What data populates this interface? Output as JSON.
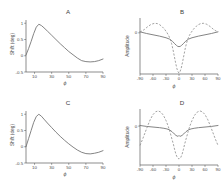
{
  "figure": {
    "panel_letters": {
      "a": "A",
      "b": "B",
      "c": "C",
      "d": "D"
    },
    "axis_labels": {
      "shift": "Shift (deg)",
      "amplitude": "Amplitude",
      "phi": "ϕ"
    }
  },
  "chart_data": [
    {
      "id": "A",
      "type": "line",
      "title": "A",
      "xlabel": "ϕ",
      "ylabel": "Shift (deg)",
      "xlim": [
        0,
        90
      ],
      "ylim": [
        -0.5,
        1.1
      ],
      "xticks": [
        10,
        30,
        50,
        70,
        90
      ],
      "yticks": [
        -0.5,
        0,
        0.5,
        1
      ],
      "ytick_labels": [
        "-0.5",
        "0",
        "0.5",
        "1"
      ],
      "grid": false,
      "legend": "none",
      "series": [
        {
          "name": "shift",
          "style": "solid",
          "color": "#6e6e6e",
          "x": [
            0,
            3,
            6,
            9,
            12,
            15,
            18,
            21,
            25,
            30,
            35,
            40,
            45,
            50,
            55,
            60,
            65,
            70,
            75,
            80,
            85,
            90
          ],
          "y": [
            0.02,
            0.22,
            0.44,
            0.68,
            0.88,
            0.97,
            0.93,
            0.86,
            0.76,
            0.63,
            0.5,
            0.37,
            0.25,
            0.13,
            0.03,
            -0.07,
            -0.15,
            -0.18,
            -0.19,
            -0.18,
            -0.15,
            -0.1
          ]
        }
      ]
    },
    {
      "id": "B",
      "type": "line",
      "title": "B",
      "xlabel": "ϕ",
      "ylabel": "Amplitude",
      "xlim": [
        -90,
        90
      ],
      "ylim": [
        -1.25,
        0.45
      ],
      "xticks": [
        -90,
        -60,
        -30,
        0,
        30,
        60,
        90
      ],
      "yticks": [
        0
      ],
      "ytick_labels": [
        "0"
      ],
      "grid": false,
      "legend": "none",
      "series": [
        {
          "name": "amplitude-solid",
          "style": "solid",
          "color": "#6e6e6e",
          "x": [
            -90,
            -75,
            -60,
            -45,
            -30,
            -22,
            -15,
            -10,
            -6,
            -3,
            0,
            3,
            6,
            10,
            15,
            22,
            30,
            45,
            60,
            75,
            90
          ],
          "y": [
            0.03,
            -0.02,
            -0.06,
            -0.1,
            -0.15,
            -0.19,
            -0.26,
            -0.33,
            -0.38,
            -0.41,
            -0.42,
            -0.41,
            -0.38,
            -0.33,
            -0.26,
            -0.19,
            -0.15,
            -0.1,
            -0.06,
            -0.02,
            0.03
          ]
        },
        {
          "name": "amplitude-dashed",
          "style": "dashed",
          "color": "#8a8a8a",
          "x": [
            -90,
            -80,
            -72,
            -64,
            -56,
            -50,
            -45,
            -40,
            -34,
            -28,
            -24,
            -20,
            -17,
            -14,
            -11,
            -8,
            -5,
            -2,
            0,
            2,
            5,
            8,
            11,
            14,
            17,
            20,
            24,
            28,
            34,
            40,
            45,
            50,
            56,
            64,
            72,
            80,
            90
          ],
          "y": [
            0.02,
            0.1,
            0.19,
            0.26,
            0.29,
            0.28,
            0.25,
            0.2,
            0.12,
            0.01,
            -0.08,
            -0.2,
            -0.33,
            -0.5,
            -0.7,
            -0.9,
            -1.08,
            -1.19,
            -1.22,
            -1.19,
            -1.08,
            -0.9,
            -0.7,
            -0.5,
            -0.33,
            -0.2,
            -0.08,
            0.01,
            0.12,
            0.2,
            0.25,
            0.28,
            0.29,
            0.26,
            0.19,
            0.1,
            0.02
          ]
        }
      ]
    },
    {
      "id": "C",
      "type": "line",
      "title": "C",
      "xlabel": "ϕ",
      "ylabel": "Shift (deg)",
      "xlim": [
        0,
        90
      ],
      "ylim": [
        -0.5,
        1.1
      ],
      "xticks": [
        10,
        30,
        50,
        70,
        90
      ],
      "yticks": [
        -0.5,
        0,
        0.5,
        1
      ],
      "ytick_labels": [
        "-0.5",
        "0",
        "0.5",
        "1"
      ],
      "grid": false,
      "legend": "none",
      "series": [
        {
          "name": "shift",
          "style": "solid",
          "color": "#6e6e6e",
          "x": [
            0,
            3,
            6,
            9,
            12,
            15,
            18,
            21,
            25,
            30,
            35,
            40,
            45,
            50,
            55,
            60,
            65,
            70,
            75,
            80,
            85,
            90
          ],
          "y": [
            0.0,
            0.25,
            0.5,
            0.75,
            0.93,
            1.0,
            0.94,
            0.85,
            0.73,
            0.59,
            0.45,
            0.32,
            0.2,
            0.09,
            -0.01,
            -0.1,
            -0.17,
            -0.21,
            -0.22,
            -0.2,
            -0.17,
            -0.12
          ]
        }
      ]
    },
    {
      "id": "D",
      "type": "line",
      "title": "D",
      "xlabel": "ϕ",
      "ylabel": "Amplitude",
      "xlim": [
        -90,
        90
      ],
      "ylim": [
        -1.25,
        0.55
      ],
      "xticks": [
        -90,
        -60,
        -30,
        0,
        30,
        60,
        90
      ],
      "yticks": [
        0
      ],
      "ytick_labels": [
        "0"
      ],
      "grid": false,
      "legend": "none",
      "series": [
        {
          "name": "amplitude-solid",
          "style": "solid",
          "color": "#6e6e6e",
          "x": [
            -90,
            -75,
            -60,
            -45,
            -35,
            -28,
            -22,
            -16,
            -11,
            -7,
            -4,
            -2,
            0,
            2,
            4,
            7,
            11,
            16,
            22,
            28,
            35,
            45,
            60,
            75,
            90
          ],
          "y": [
            0.02,
            -0.01,
            -0.03,
            -0.05,
            -0.07,
            -0.09,
            -0.12,
            -0.18,
            -0.25,
            -0.3,
            -0.32,
            -0.33,
            -0.3,
            -0.33,
            -0.32,
            -0.3,
            -0.25,
            -0.18,
            -0.12,
            -0.09,
            -0.07,
            -0.05,
            -0.03,
            -0.01,
            0.02
          ]
        },
        {
          "name": "amplitude-dashed",
          "style": "dashed",
          "color": "#8a8a8a",
          "x": [
            -90,
            -84,
            -78,
            -72,
            -66,
            -60,
            -54,
            -48,
            -42,
            -36,
            -30,
            -25,
            -21,
            -17,
            -13,
            -10,
            -7,
            -4,
            0,
            4,
            7,
            10,
            13,
            17,
            21,
            25,
            30,
            36,
            42,
            48,
            54,
            60,
            66,
            72,
            78,
            84,
            90
          ],
          "y": [
            -0.62,
            -0.42,
            -0.2,
            0.02,
            0.22,
            0.37,
            0.46,
            0.49,
            0.45,
            0.35,
            0.18,
            0.0,
            -0.18,
            -0.38,
            -0.58,
            -0.76,
            -0.91,
            -1.01,
            -1.06,
            -1.01,
            -0.91,
            -0.76,
            -0.58,
            -0.38,
            -0.18,
            0.0,
            0.18,
            0.35,
            0.45,
            0.49,
            0.46,
            0.37,
            0.22,
            0.02,
            -0.2,
            -0.42,
            -0.62
          ]
        }
      ]
    }
  ]
}
